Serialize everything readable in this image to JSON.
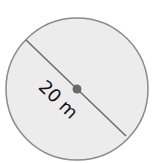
{
  "diagram": {
    "shape": "circle",
    "measurement_label": "20 m",
    "measured_segment": "diameter",
    "colors": {
      "background": "#ffffff",
      "circle_fill": "#ececec",
      "circle_stroke": "#8a8a8a",
      "diameter_line": "#6e6e6e",
      "center_point": "#6a6a6a",
      "label_text": "#111111"
    }
  }
}
